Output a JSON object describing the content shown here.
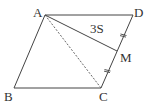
{
  "figure": {
    "type": "parallelogram",
    "vertices": {
      "A": {
        "label": "A",
        "x": 45,
        "y": 15
      },
      "D": {
        "label": "D",
        "x": 133,
        "y": 15
      },
      "C": {
        "label": "C",
        "x": 101,
        "y": 88
      },
      "B": {
        "label": "B",
        "x": 14,
        "y": 88
      },
      "M": {
        "label": "M",
        "x": 117,
        "y": 51
      }
    },
    "edges": [
      "AD",
      "DC",
      "CB",
      "BA"
    ],
    "segments": {
      "solid": [
        "AM"
      ],
      "dashed": [
        "AC"
      ]
    },
    "equal_marks": [
      "DM",
      "MC"
    ],
    "area_label": "3S",
    "colors": {
      "line": "#444444",
      "text": "#333333",
      "background": "#ffffff"
    }
  }
}
